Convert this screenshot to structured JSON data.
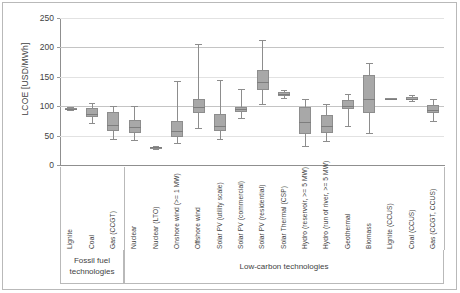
{
  "chart_data": {
    "type": "box",
    "title": "",
    "xlabel": "",
    "ylabel": "LCOE [USD/MWh]",
    "ylim": [
      0,
      250
    ],
    "yticks": [
      0,
      50,
      100,
      150,
      200,
      250
    ],
    "grid": "horizontal",
    "legend": "none",
    "categories": [
      "Lignite",
      "Coal",
      "Gas (CCGT)",
      "Nuclear",
      "Nuclear (LTO)",
      "Onshore wind (>= 1 MW)",
      "Offshore wind",
      "Solar PV (utility scale)",
      "Solar PV (commercial)",
      "Solar PV (residential)",
      "Solar Thermal (CSP)",
      "Hydro (reservoir, >= 5 MW)",
      "Hydro (run of river, >= 5 MW)",
      "Geothermal",
      "Biomass",
      "Lignite (CCUS)",
      "Coal (CCUS)",
      "Gas (CCGT, CCUS)"
    ],
    "boxes": [
      {
        "name": "Lignite",
        "min": 93,
        "q1": 95,
        "median": 96,
        "q3": 97,
        "max": 99
      },
      {
        "name": "Coal",
        "min": 72,
        "q1": 82,
        "median": 86,
        "q3": 97,
        "max": 106
      },
      {
        "name": "Gas (CCGT)",
        "min": 45,
        "q1": 57,
        "median": 68,
        "q3": 90,
        "max": 100
      },
      {
        "name": "Nuclear",
        "min": 42,
        "q1": 55,
        "median": 65,
        "q3": 76,
        "max": 100
      },
      {
        "name": "Nuclear (LTO)",
        "min": 27,
        "q1": 29,
        "median": 30,
        "q3": 31,
        "max": 33
      },
      {
        "name": "Onshore wind (>= 1 MW)",
        "min": 38,
        "q1": 48,
        "median": 58,
        "q3": 74,
        "max": 143
      },
      {
        "name": "Offshore wind",
        "min": 63,
        "q1": 88,
        "median": 98,
        "q3": 113,
        "max": 205
      },
      {
        "name": "Solar PV (utility scale)",
        "min": 44,
        "q1": 57,
        "median": 67,
        "q3": 86,
        "max": 145
      },
      {
        "name": "Solar PV (commercial)",
        "min": 80,
        "q1": 90,
        "median": 95,
        "q3": 99,
        "max": 129
      },
      {
        "name": "Solar PV (residential)",
        "min": 103,
        "q1": 128,
        "median": 141,
        "q3": 162,
        "max": 212
      },
      {
        "name": "Solar Thermal (CSP)",
        "min": 114,
        "q1": 118,
        "median": 121,
        "q3": 124,
        "max": 127
      },
      {
        "name": "Hydro (reservoir, >= 5 MW)",
        "min": 33,
        "q1": 52,
        "median": 73,
        "q3": 99,
        "max": 113
      },
      {
        "name": "Hydro (run of river, >= 5 MW)",
        "min": 41,
        "q1": 55,
        "median": 66,
        "q3": 85,
        "max": 104
      },
      {
        "name": "Geothermal",
        "min": 67,
        "q1": 95,
        "median": 101,
        "q3": 110,
        "max": 120
      },
      {
        "name": "Biomass",
        "min": 55,
        "q1": 89,
        "median": 112,
        "q3": 153,
        "max": 174
      },
      {
        "name": "Lignite (CCUS)",
        "min": 112,
        "q1": 112,
        "median": 113,
        "q3": 114,
        "max": 114
      },
      {
        "name": "Coal (CCUS)",
        "min": 108,
        "q1": 111,
        "median": 113,
        "q3": 116,
        "max": 119
      },
      {
        "name": "Gas (CCGT, CCUS)",
        "min": 75,
        "q1": 88,
        "median": 94,
        "q3": 102,
        "max": 112
      }
    ],
    "groups": [
      {
        "label": "Fossil fuel\ntechnologies",
        "line1": "Fossil fuel",
        "line2": "technologies",
        "start": 0,
        "end": 2
      },
      {
        "label": "Low-carbon technologies",
        "line1": "Low-carbon technologies",
        "line2": "",
        "start": 3,
        "end": 17
      }
    ]
  },
  "axis": {
    "y_title": "LCOE [USD/MWh]",
    "y_ticks": [
      "250",
      "200",
      "150",
      "100",
      "50",
      "0"
    ]
  },
  "groups": {
    "fossil_line1": "Fossil fuel",
    "fossil_line2": "technologies",
    "lowcarbon_line1": "Low-carbon technologies"
  },
  "colors": {
    "box_fill": "#a8a8a8",
    "box_stroke": "#8d8d8d",
    "gridline": "#c4c4c4",
    "axis": "#8f8f8f",
    "frame": "#b9b9b9",
    "text": "#3f3f3f"
  }
}
